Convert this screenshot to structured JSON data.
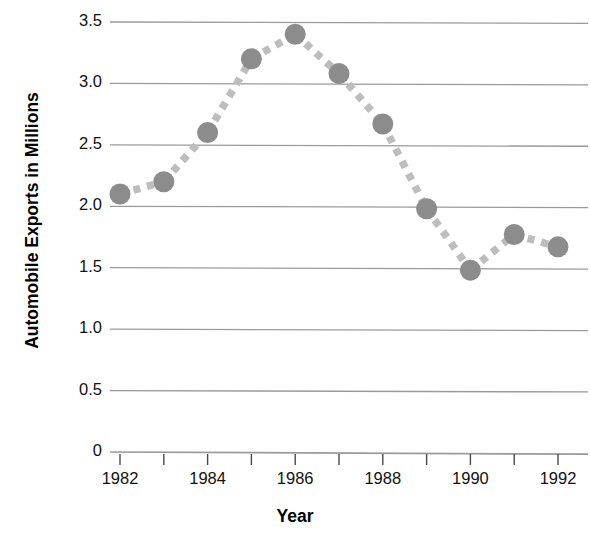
{
  "chart_data": {
    "type": "scatter",
    "title": "",
    "xlabel": "Year",
    "ylabel": "Automobile Exports in Millions",
    "x": [
      1982,
      1983,
      1984,
      1985,
      1986,
      1987,
      1988,
      1989,
      1990,
      1991,
      1992
    ],
    "values": [
      2.1,
      2.2,
      2.6,
      3.2,
      3.4,
      3.08,
      2.67,
      1.98,
      1.48,
      1.77,
      1.67
    ],
    "series": [
      {
        "name": "Automobile Exports",
        "values": [
          2.1,
          2.2,
          2.6,
          3.2,
          3.4,
          3.08,
          2.67,
          1.98,
          1.48,
          1.77,
          1.67
        ]
      }
    ],
    "xlim": [
      1982,
      1992
    ],
    "ylim": [
      0,
      3.5
    ],
    "x_tick_labels": [
      "1982",
      "",
      "1984",
      "",
      "1986",
      "",
      "1988",
      "",
      "1990",
      "",
      "1992"
    ],
    "x_tick_values": [
      1982,
      1983,
      1984,
      1985,
      1986,
      1987,
      1988,
      1989,
      1990,
      1991,
      1992
    ],
    "y_tick_labels": [
      "0",
      "0.5",
      "1.0",
      "1.5",
      "2.0",
      "2.5",
      "3.0",
      "3.5"
    ],
    "y_tick_values": [
      0,
      0.5,
      1.0,
      1.5,
      2.0,
      2.5,
      3.0,
      3.5
    ],
    "grid": true,
    "grid_axis": "y",
    "legend": null,
    "legend_position": "none",
    "marker": "circle",
    "line_style": "dotted",
    "colors": {
      "marker": "#8c8c8c",
      "line": "#bdbdbd",
      "grid": "#9a9a9a",
      "axis": "#9a9a9a",
      "text": "#111111"
    }
  },
  "axes": {
    "y_title": "Automobile Exports in Millions",
    "x_title": "Year"
  },
  "y_ticks": [
    {
      "label": "3.5",
      "value": 3.5
    },
    {
      "label": "3.0",
      "value": 3.0
    },
    {
      "label": "2.5",
      "value": 2.5
    },
    {
      "label": "2.0",
      "value": 2.0
    },
    {
      "label": "1.5",
      "value": 1.5
    },
    {
      "label": "1.0",
      "value": 1.0
    },
    {
      "label": "0.5",
      "value": 0.5
    },
    {
      "label": "0",
      "value": 0
    }
  ],
  "x_ticks": [
    {
      "label": "1982",
      "value": 1982
    },
    {
      "label": "1984",
      "value": 1984
    },
    {
      "label": "1986",
      "value": 1986
    },
    {
      "label": "1988",
      "value": 1988
    },
    {
      "label": "1990",
      "value": 1990
    },
    {
      "label": "1992",
      "value": 1992
    }
  ]
}
